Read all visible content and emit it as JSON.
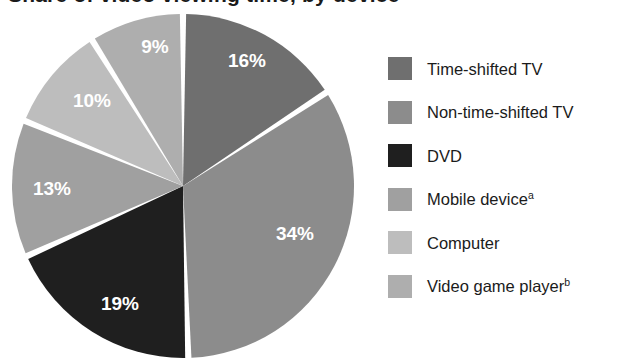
{
  "title": {
    "text": "Share of video viewing time, by device",
    "clipped": true
  },
  "chart_data": {
    "type": "pie",
    "title": "Share of video viewing time, by device",
    "categories": [
      "Time-shifted TV",
      "Non-time-shifted TV",
      "DVD",
      "Mobile device",
      "Computer",
      "Video game player"
    ],
    "values": [
      16,
      34,
      19,
      13,
      10,
      9
    ],
    "value_labels": [
      "16%",
      "34%",
      "19%",
      "13%",
      "10%",
      "9%"
    ],
    "unit": "percent",
    "start_angle_deg": 0,
    "direction": "clockwise",
    "legend_position": "right",
    "grid": false,
    "colors": [
      "#6f6f6f",
      "#8c8c8c",
      "#1f1f1f",
      "#a0a0a0",
      "#bdbdbd",
      "#aeaeae"
    ],
    "slice_label_color": "#ffffff",
    "separator_color": "#ffffff",
    "footnote_markers": {
      "Mobile device": "a",
      "Video game player": "b"
    }
  },
  "pie": {
    "center_x": 183,
    "center_y": 186,
    "radius_x": 171,
    "radius_y": 172,
    "slices": [
      {
        "name": "Time-shifted TV",
        "value": 16,
        "label": "16%",
        "color": "#6f6f6f",
        "label_x": 247,
        "label_y": 62
      },
      {
        "name": "Non-time-shifted TV",
        "value": 34,
        "label": "34%",
        "color": "#8c8c8c",
        "label_x": 295,
        "label_y": 235
      },
      {
        "name": "DVD",
        "value": 19,
        "label": "19%",
        "color": "#1f1f1f",
        "label_x": 120,
        "label_y": 305
      },
      {
        "name": "Mobile device",
        "value": 13,
        "label": "13%",
        "color": "#a0a0a0",
        "label_x": 52,
        "label_y": 190
      },
      {
        "name": "Computer",
        "value": 10,
        "label": "10%",
        "color": "#bdbdbd",
        "label_x": 92,
        "label_y": 102
      },
      {
        "name": "Video game player",
        "value": 9,
        "label": "9%",
        "color": "#aeaeae",
        "label_x": 155,
        "label_y": 48
      }
    ]
  },
  "legend": {
    "items": [
      {
        "label": "Time-shifted TV",
        "sup": "",
        "color": "#6f6f6f"
      },
      {
        "label": "Non-time-shifted TV",
        "sup": "",
        "color": "#8c8c8c"
      },
      {
        "label": "DVD",
        "sup": "",
        "color": "#1f1f1f"
      },
      {
        "label": "Mobile device",
        "sup": "a",
        "color": "#a0a0a0"
      },
      {
        "label": "Computer",
        "sup": "",
        "color": "#bdbdbd"
      },
      {
        "label": "Video game player",
        "sup": "b",
        "color": "#aeaeae"
      }
    ]
  }
}
